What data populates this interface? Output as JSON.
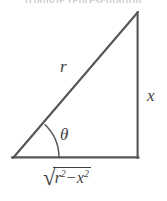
{
  "figure": {
    "name": "right-triangle-trig-diagram",
    "clipped_caption": "triangle representation",
    "stroke_color": "#555555",
    "label_color": "#3f3f3f",
    "background_color": "#ffffff"
  },
  "labels": {
    "hypotenuse": "r",
    "opposite_side": "x",
    "angle": "θ",
    "adjacent_side": {
      "radical_sign": "√",
      "term1_base": "r",
      "term1_exponent": "2",
      "operator": "−",
      "term2_base": "x",
      "term2_exponent": "2",
      "plain": "√(r² − x²)"
    }
  },
  "geometry": {
    "vertex_bottom_left": [
      13,
      158
    ],
    "vertex_bottom_right": [
      138,
      158
    ],
    "vertex_top_right": [
      138,
      12
    ],
    "angle_arc_radius": 46,
    "stroke_width": 2
  }
}
